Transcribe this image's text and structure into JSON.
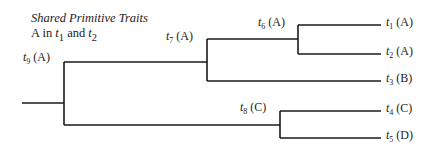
{
  "caption": {
    "title": "Shared Primitive Traits",
    "subtitle_prefix": "A in ",
    "subtitle_t1": "t",
    "subtitle_t1_sub": "1",
    "subtitle_and": " and ",
    "subtitle_t2": "t",
    "subtitle_t2_sub": "2"
  },
  "nodes": {
    "t9": {
      "var": "t",
      "sub": "9",
      "state": " (A)"
    },
    "t7": {
      "var": "t",
      "sub": "7",
      "state": " (A)"
    },
    "t6": {
      "var": "t",
      "sub": "6",
      "state": " (A)"
    },
    "t8": {
      "var": "t",
      "sub": "8",
      "state": " (C)"
    }
  },
  "leaves": [
    {
      "var": "t",
      "sub": "1",
      "state": " (A)"
    },
    {
      "var": "t",
      "sub": "2",
      "state": " (A)"
    },
    {
      "var": "t",
      "sub": "3",
      "state": " (B)"
    },
    {
      "var": "t",
      "sub": "4",
      "state": " (C)"
    },
    {
      "var": "t",
      "sub": "5",
      "state": " (D)"
    }
  ],
  "colors": {
    "line": "#1a1a1a",
    "text": "#222222"
  }
}
